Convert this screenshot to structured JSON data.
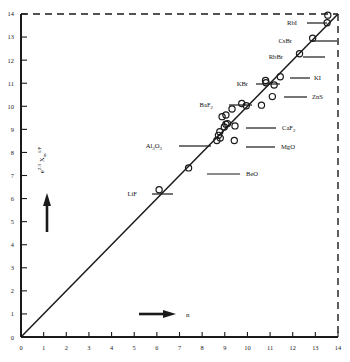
{
  "figure": {
    "name": "refractive-index-correlation-plot",
    "background": "#ffffff",
    "ink": "#1a1a1a"
  },
  "chart_data": {
    "type": "scatter",
    "title": "",
    "subtitle": "",
    "xlabel": "n",
    "ylabel": "e 2.3 Xm 1/P",
    "ylabel_parts": {
      "base": "e",
      "exp1": "2.3",
      "sym": "X",
      "sub": "m",
      "exp2": "1/P"
    },
    "xlim": [
      0,
      14
    ],
    "ylim": [
      0,
      14
    ],
    "xticks": [
      0,
      1,
      2,
      3,
      4,
      5,
      6,
      7,
      8,
      9,
      10,
      11,
      12,
      13,
      14
    ],
    "yticks": [
      0,
      1,
      2,
      3,
      4,
      5,
      6,
      7,
      8,
      9,
      10,
      11,
      12,
      13,
      14
    ],
    "xticklabels": [
      "0",
      "1",
      "2",
      "3",
      "4",
      "5",
      "6",
      "7",
      "8",
      "9",
      "10",
      "11",
      "12",
      "13",
      "14"
    ],
    "yticklabels": [
      "0",
      "1",
      "2",
      "3",
      "4",
      "5",
      "6",
      "7",
      "8",
      "9",
      "10",
      "11",
      "12",
      "13",
      "14"
    ],
    "grid": false,
    "legend": "none",
    "marker": "open-circle",
    "reference_line": {
      "name": "one-to-one-line",
      "from": [
        0,
        0
      ],
      "to": [
        14,
        14
      ],
      "style": "solid",
      "label": "y = x"
    },
    "frame": {
      "left": "solid",
      "bottom": "solid",
      "top": "dashed",
      "right": "dashed"
    },
    "x_direction_arrow": {
      "label": "n",
      "direction": "right"
    },
    "y_direction_arrow": {
      "label": "",
      "direction": "up"
    },
    "points": [
      {
        "label": "LiF",
        "x": 6.1,
        "y": 6.38,
        "labeled": true,
        "leader": "left"
      },
      {
        "label": "BeO",
        "x": 7.4,
        "y": 7.33,
        "labeled": true,
        "leader": "right"
      },
      {
        "label": "Al2O3",
        "x": 8.65,
        "y": 8.52,
        "labeled": true,
        "leader": "left"
      },
      {
        "label": "MgO",
        "x": 9.42,
        "y": 8.52,
        "labeled": true,
        "leader": "right"
      },
      {
        "label": "CaF2",
        "x": 9.45,
        "y": 9.15,
        "labeled": true,
        "leader": "right"
      },
      {
        "label": "BaF2",
        "x": 9.75,
        "y": 10.12,
        "labeled": true,
        "leader": "left"
      },
      {
        "label": "KBr",
        "x": 10.8,
        "y": 11.12,
        "labeled": true,
        "leader": "left"
      },
      {
        "label": "KI",
        "x": 11.45,
        "y": 11.28,
        "labeled": true,
        "leader": "right"
      },
      {
        "label": "ZnS",
        "x": 11.1,
        "y": 10.42,
        "labeled": true,
        "leader": "right"
      },
      {
        "label": "RbBr",
        "x": 12.3,
        "y": 12.28,
        "labeled": true,
        "leader": "left"
      },
      {
        "label": "CsBr",
        "x": 12.88,
        "y": 12.95,
        "labeled": true,
        "leader": "left"
      },
      {
        "label": "RbI",
        "x": 13.52,
        "y": 13.62,
        "labeled": true,
        "leader": "left"
      },
      {
        "label": "",
        "x": 8.72,
        "y": 8.74,
        "labeled": false,
        "leader": ""
      },
      {
        "label": "",
        "x": 8.78,
        "y": 8.9,
        "labeled": false,
        "leader": ""
      },
      {
        "label": "",
        "x": 8.8,
        "y": 8.62,
        "labeled": false,
        "leader": ""
      },
      {
        "label": "",
        "x": 8.98,
        "y": 9.1,
        "labeled": false,
        "leader": ""
      },
      {
        "label": "",
        "x": 9.05,
        "y": 9.22,
        "labeled": false,
        "leader": ""
      },
      {
        "label": "",
        "x": 9.12,
        "y": 9.25,
        "labeled": false,
        "leader": ""
      },
      {
        "label": "",
        "x": 8.88,
        "y": 9.55,
        "labeled": false,
        "leader": ""
      },
      {
        "label": "",
        "x": 9.05,
        "y": 9.62,
        "labeled": false,
        "leader": ""
      },
      {
        "label": "",
        "x": 9.32,
        "y": 9.88,
        "labeled": false,
        "leader": ""
      },
      {
        "label": "",
        "x": 9.95,
        "y": 10.02,
        "labeled": false,
        "leader": ""
      },
      {
        "label": "",
        "x": 10.62,
        "y": 10.05,
        "labeled": false,
        "leader": ""
      },
      {
        "label": "",
        "x": 10.82,
        "y": 11.02,
        "labeled": false,
        "leader": ""
      },
      {
        "label": "",
        "x": 11.18,
        "y": 10.92,
        "labeled": false,
        "leader": ""
      },
      {
        "label": "",
        "x": 13.55,
        "y": 13.95,
        "labeled": false,
        "leader": ""
      }
    ]
  }
}
